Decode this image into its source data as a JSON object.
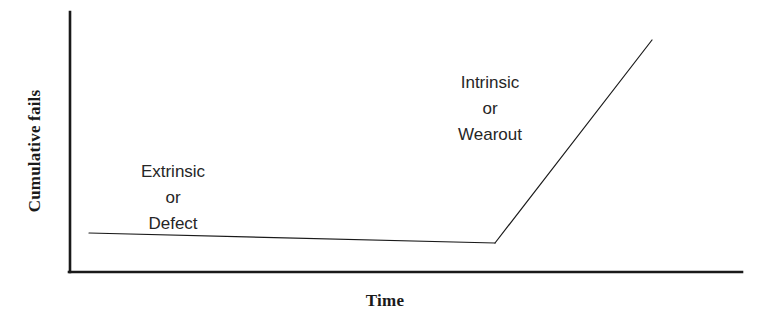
{
  "figure": {
    "width": 768,
    "height": 323,
    "background_color": "#ffffff",
    "line_color": "#1a1a1a",
    "text_color": "#262626"
  },
  "axes": {
    "y_title": "Cumulative fails",
    "x_title": "Time",
    "origin": {
      "x": 70,
      "y": 272
    },
    "y_top": 12,
    "x_right": 742,
    "axis_line_width": 2.6,
    "ticks_shown": false,
    "tick_labels": []
  },
  "annotations": [
    {
      "name": "extrinsic-or-defect",
      "lines": [
        "Extrinsic",
        "or",
        "Defect"
      ],
      "center": {
        "x": 173,
        "y": 198
      }
    },
    {
      "name": "intrinsic-or-wearout",
      "lines": [
        "Intrinsic",
        "or",
        "Wearout"
      ],
      "center": {
        "x": 490,
        "y": 109
      }
    }
  ],
  "chart_data": {
    "type": "line",
    "title": "",
    "subtitle": "",
    "xlabel": "Time",
    "ylabel": "Cumulative fails",
    "xlim": [
      0,
      1
    ],
    "ylim": [
      0,
      1
    ],
    "grid": false,
    "legend": null,
    "axis_tick_labels": {
      "x": [],
      "y": []
    },
    "series": [
      {
        "name": "Cumulative fails curve",
        "stroke_color": "#1a1a1a",
        "stroke_width": 1.2,
        "points_px": [
          {
            "x": 89,
            "y": 233
          },
          {
            "x": 495,
            "y": 243
          },
          {
            "x": 652,
            "y": 40
          }
        ],
        "points_normalized": [
          {
            "x": 0.028,
            "y": 0.15
          },
          {
            "x": 0.632,
            "y": 0.112
          },
          {
            "x": 0.866,
            "y": 0.892
          }
        ],
        "segments": [
          {
            "label": "Extrinsic or Defect",
            "description": "Long nearly flat low-slope region: early/defect-related failures accumulate slowly",
            "from_px": {
              "x": 89,
              "y": 233
            },
            "to_px": {
              "x": 495,
              "y": 243
            }
          },
          {
            "label": "Intrinsic or Wearout",
            "description": "Steeply rising region after the knee: wearout failures accumulate rapidly",
            "from_px": {
              "x": 495,
              "y": 243
            },
            "to_px": {
              "x": 652,
              "y": 40
            }
          }
        ],
        "knee_px": {
          "x": 495,
          "y": 243
        }
      }
    ]
  }
}
